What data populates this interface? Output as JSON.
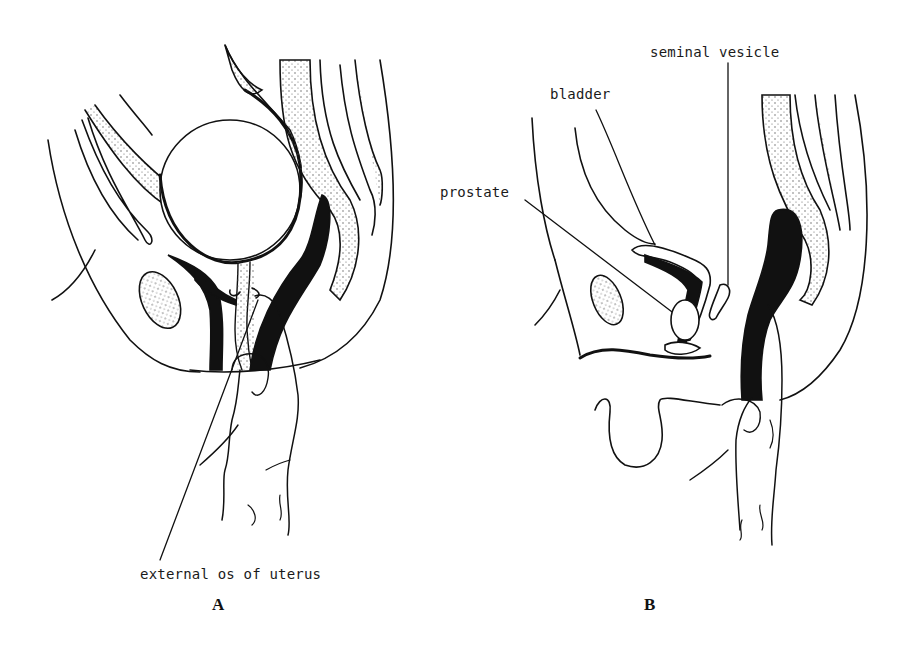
{
  "figure": {
    "panels": [
      {
        "id": "A",
        "letter": "A",
        "labels": [
          {
            "text": "external os of uterus"
          }
        ]
      },
      {
        "id": "B",
        "letter": "B",
        "labels": [
          {
            "text": "seminal vesicle"
          },
          {
            "text": "bladder"
          },
          {
            "text": "prostate"
          }
        ]
      }
    ],
    "colors": {
      "ink": "#111111",
      "background": "#ffffff",
      "stipple": "#555555"
    }
  }
}
